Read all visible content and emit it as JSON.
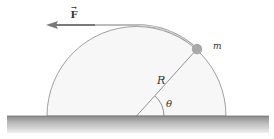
{
  "diagram": {
    "type": "physics-free-body",
    "labels": {
      "force": "F",
      "force_vector_mark": "→",
      "mass": "m",
      "radius": "R",
      "angle": "θ"
    },
    "colors": {
      "hemisphere_fill": "#f7f7f7",
      "hemisphere_stroke": "#888888",
      "ground_top": "#8a8a8a",
      "ground_bottom": "#e8e8e8",
      "arrow": "#7a7a7a",
      "ball": "#a8a8a8",
      "rope": "#9a9a9a",
      "line": "#777777"
    },
    "geometry": {
      "center_x": 136.5,
      "ground_y": 116,
      "radius": 89.5,
      "ball_x": 197,
      "ball_y": 49,
      "ball_r": 5
    }
  }
}
